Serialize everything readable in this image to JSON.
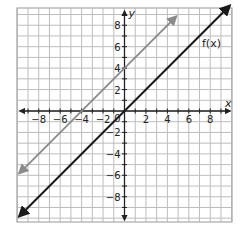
{
  "chart_data": {
    "type": "line",
    "title": "",
    "xlabel": "x",
    "ylabel": "y",
    "xlim": [
      -10,
      10
    ],
    "ylim": [
      -10,
      10
    ],
    "grid": true,
    "x_ticks": [
      -8,
      -6,
      -4,
      -2,
      2,
      4,
      6,
      8
    ],
    "y_ticks": [
      8,
      6,
      4,
      2,
      -2,
      -4,
      -6,
      -8
    ],
    "x_tick_labels": [
      "−8",
      "−6",
      "−4",
      "−2",
      "2",
      "4",
      "6",
      "8"
    ],
    "y_tick_labels": [
      "8",
      "6",
      "4",
      "2",
      "−2",
      "−4",
      "−6",
      "−8"
    ],
    "origin_label": "0",
    "series": [
      {
        "name": "f(x)",
        "label": "f(x)",
        "equation": "y = x",
        "color": "#1a1a1a",
        "x": [
          -10,
          10
        ],
        "y": [
          -10,
          10
        ],
        "arrows": "both"
      },
      {
        "name": "translated line",
        "label": "",
        "equation": "y = x + 4",
        "color": "#8a8a8a",
        "x": [
          -10,
          5
        ],
        "y": [
          -6,
          9
        ],
        "arrows": "both"
      }
    ],
    "annotations": [
      {
        "text": "f(x)",
        "x": 7.3,
        "y": 7.5
      }
    ]
  },
  "colors": {
    "grid": "#bdbdbd",
    "grid_border": "#a8a8a8",
    "axis": "#222222",
    "f_line": "#1a1a1a",
    "g_line": "#8a8a8a"
  }
}
